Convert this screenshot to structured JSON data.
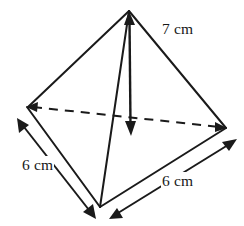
{
  "figure": {
    "shape_name": "tetrahedron",
    "stroke_color": "#1a1a1a",
    "background_color": "#ffffff",
    "labels": {
      "slant_height": "7 cm",
      "base_edge_left": "6 cm",
      "base_edge_right": "6 cm"
    },
    "measurements": [
      {
        "name": "slant-edge",
        "value": 7,
        "unit": "cm",
        "text": "7 cm"
      },
      {
        "name": "base-edge-left",
        "value": 6,
        "unit": "cm",
        "text": "6 cm"
      },
      {
        "name": "base-edge-right",
        "value": 6,
        "unit": "cm",
        "text": "6 cm"
      }
    ],
    "vertices": {
      "apex": {
        "x": 129,
        "y": 10
      },
      "rear_left": {
        "x": 27,
        "y": 107
      },
      "rear_right": {
        "x": 226,
        "y": 128
      },
      "front": {
        "x": 100,
        "y": 207
      }
    },
    "edges": [
      {
        "name": "apex-to-rear-left",
        "style": "solid"
      },
      {
        "name": "apex-to-rear-right",
        "style": "solid"
      },
      {
        "name": "apex-to-front",
        "style": "solid"
      },
      {
        "name": "rear-left-to-front",
        "style": "solid"
      },
      {
        "name": "rear-right-to-front",
        "style": "solid"
      },
      {
        "name": "rear-left-to-rear-right",
        "style": "dashed"
      }
    ],
    "height_arrow": {
      "name": "vertical-height-arrow",
      "from": {
        "x": 129,
        "y": 12
      },
      "to": {
        "x": 131,
        "y": 135
      },
      "heads": "both"
    },
    "dimension_arrows": [
      {
        "name": "left-base-dimension-arrow",
        "from": {
          "x": 18,
          "y": 120
        },
        "to": {
          "x": 95,
          "y": 218
        },
        "heads": "both"
      },
      {
        "name": "right-base-dimension-arrow",
        "from": {
          "x": 110,
          "y": 218
        },
        "to": {
          "x": 236,
          "y": 140
        },
        "heads": "both"
      }
    ]
  }
}
